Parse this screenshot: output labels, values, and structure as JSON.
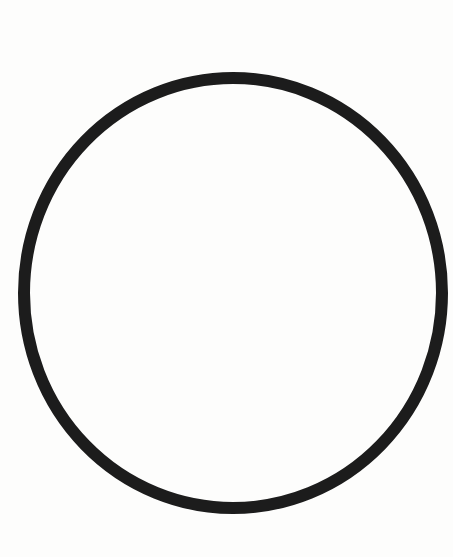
{
  "figure": {
    "shape": "circle",
    "stroke_color": "#1c1c1c",
    "background_color": "#fdfdfc",
    "center": [
      233,
      293
    ],
    "radius_x": 209,
    "radius_y": 215,
    "stroke_width": 12
  }
}
